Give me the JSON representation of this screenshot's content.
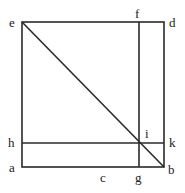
{
  "diagram": {
    "type": "geometric-figure",
    "colors": {
      "line": "#2a2a2a",
      "label": "#222222",
      "background": "#ffffff"
    },
    "points": {
      "e": {
        "label": "e",
        "x": 22,
        "y": 22
      },
      "f": {
        "label": "f",
        "x": 139,
        "y": 22
      },
      "d": {
        "label": "d",
        "x": 164,
        "y": 22
      },
      "h": {
        "label": "h",
        "x": 22,
        "y": 143
      },
      "i": {
        "label": "i",
        "x": 139,
        "y": 143
      },
      "k": {
        "label": "k",
        "x": 164,
        "y": 143
      },
      "a": {
        "label": "a",
        "x": 22,
        "y": 167
      },
      "c": {
        "label": "c",
        "x": 104,
        "y": 167
      },
      "g": {
        "label": "g",
        "x": 139,
        "y": 167
      },
      "b": {
        "label": "b",
        "x": 164,
        "y": 167
      }
    },
    "segments": [
      [
        "e",
        "d"
      ],
      [
        "d",
        "b"
      ],
      [
        "b",
        "a"
      ],
      [
        "a",
        "e"
      ],
      [
        "f",
        "g"
      ],
      [
        "h",
        "k"
      ],
      [
        "e",
        "b"
      ]
    ]
  }
}
